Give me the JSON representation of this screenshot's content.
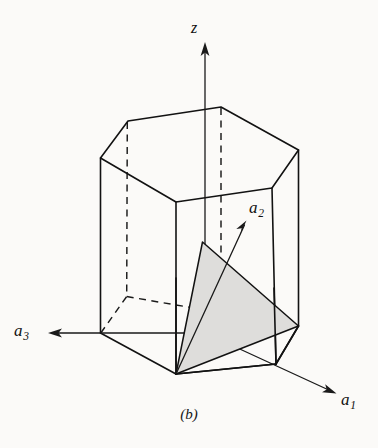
{
  "figure": {
    "caption": "(b)",
    "background_color": "#fbfaf8",
    "line_color": "#121212",
    "plane_fill_color": "#dedddb"
  },
  "axes": [
    {
      "id": "z",
      "label": "z",
      "subscript": "",
      "direction": "up",
      "origin": [
        205,
        333
      ],
      "tip": [
        205,
        44
      ],
      "style": "solid-arrow"
    },
    {
      "id": "a1",
      "label": "a",
      "subscript": "1",
      "direction": "down-right",
      "origin": [
        205,
        333
      ],
      "tip": [
        335,
        393
      ],
      "style": "solid-arrow"
    },
    {
      "id": "a2",
      "label": "a",
      "subscript": "2",
      "direction": "up-right",
      "origin": [
        176,
        374
      ],
      "tip": [
        246,
        221
      ],
      "style": "solid-arrow"
    },
    {
      "id": "a3",
      "label": "a",
      "subscript": "3",
      "direction": "left",
      "origin": [
        205,
        333
      ],
      "tip": [
        50,
        333
      ],
      "style": "solid-arrow"
    }
  ],
  "prism": {
    "shape": "hexagonal-prism",
    "top_face_vertices": [
      [
        100.5,
        158
      ],
      [
        128,
        121
      ],
      [
        221,
        107
      ],
      [
        298.5,
        150
      ],
      [
        272,
        188
      ],
      [
        176,
        202
      ]
    ],
    "bottom_face_vertices": [
      [
        100.5,
        333
      ],
      [
        126.5,
        296.5
      ],
      [
        221,
        283
      ],
      [
        298.5,
        326
      ],
      [
        276,
        364
      ],
      [
        176,
        374
      ]
    ],
    "vertical_edges": [
      [
        [
          100.5,
          158
        ],
        [
          100.5,
          333
        ]
      ],
      [
        [
          128,
          121
        ],
        [
          126.5,
          296.5
        ]
      ],
      [
        [
          221,
          107
        ],
        [
          221,
          283
        ]
      ],
      [
        [
          298.5,
          150
        ],
        [
          298.5,
          326
        ]
      ],
      [
        [
          272,
          188
        ],
        [
          276,
          364
        ]
      ],
      [
        [
          176,
          202
        ],
        [
          176,
          374
        ]
      ]
    ],
    "hidden_edges_note": "back-left vertical edge and the two bottom-back hexagon edges are dashed"
  },
  "plane": {
    "name": "shaded-plane",
    "type": "triangle",
    "vertices": [
      [
        202.5,
        242
      ],
      [
        298.5,
        326
      ],
      [
        176,
        374
      ]
    ],
    "fill": "#dedddb"
  }
}
